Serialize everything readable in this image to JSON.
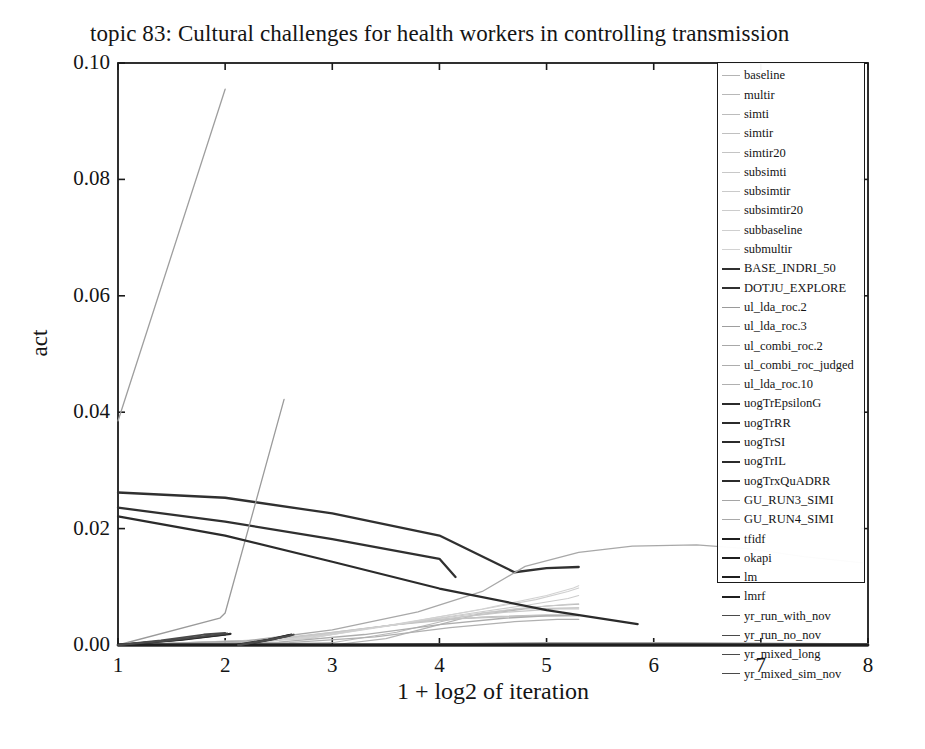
{
  "chart_data": {
    "type": "line",
    "title": "topic 83: Cultural challenges for health workers in controlling transmission",
    "xlabel": "1 + log2 of iteration",
    "ylabel": "act",
    "xlim": [
      1,
      8
    ],
    "ylim": [
      0.0,
      0.1
    ],
    "xticks": [
      "1",
      "2",
      "3",
      "4",
      "5",
      "6",
      "7",
      "8"
    ],
    "yticks": [
      "0.00",
      "0.02",
      "0.04",
      "0.06",
      "0.08",
      "0.10"
    ],
    "grid": false,
    "legend_position": "top-right-inside",
    "series": [
      {
        "name": "baseline",
        "color": "#b4b4b4",
        "width": 1.1,
        "points": [
          [
            1,
            0.0
          ],
          [
            2,
            0.0
          ],
          [
            3,
            0.0
          ],
          [
            3.5,
            0.0011
          ],
          [
            4,
            0.0035
          ],
          [
            4.4,
            0.0055
          ],
          [
            5,
            0.0067
          ],
          [
            5.3,
            0.007
          ]
        ]
      },
      {
        "name": "multir",
        "color": "#b8b8b8",
        "width": 1.1,
        "points": [
          [
            1,
            0.0
          ],
          [
            2,
            0.0
          ],
          [
            3,
            0.0004
          ],
          [
            3.6,
            0.0022
          ],
          [
            4.2,
            0.0048
          ],
          [
            4.8,
            0.0062
          ],
          [
            5.3,
            0.0064
          ]
        ]
      },
      {
        "name": "simti",
        "color": "#bcbcbc",
        "width": 1.1,
        "points": [
          [
            1,
            0.0
          ],
          [
            2,
            0.0002
          ],
          [
            2.8,
            0.0012
          ],
          [
            3.4,
            0.003
          ],
          [
            3.9,
            0.0042
          ],
          [
            4.5,
            0.0049
          ],
          [
            5.0,
            0.0052
          ],
          [
            5.3,
            0.0052
          ]
        ]
      },
      {
        "name": "simtir",
        "color": "#c0c0c0",
        "width": 1.1,
        "points": [
          [
            1,
            0.0
          ],
          [
            2,
            0.0003
          ],
          [
            2.9,
            0.0018
          ],
          [
            3.6,
            0.0035
          ],
          [
            4.2,
            0.0045
          ],
          [
            4.8,
            0.005
          ],
          [
            5.3,
            0.0051
          ]
        ]
      },
      {
        "name": "simtir20",
        "color": "#c4c4c4",
        "width": 1.1,
        "points": [
          [
            1,
            0.0
          ],
          [
            2.2,
            0.0006
          ],
          [
            3.0,
            0.0022
          ],
          [
            3.8,
            0.004
          ],
          [
            4.4,
            0.0048
          ],
          [
            5.0,
            0.005
          ],
          [
            5.3,
            0.005
          ]
        ]
      },
      {
        "name": "subsimti",
        "color": "#c8c8c8",
        "width": 1.1,
        "points": [
          [
            1,
            0.0
          ],
          [
            2.4,
            0.0008
          ],
          [
            3.2,
            0.0026
          ],
          [
            4.0,
            0.0044
          ],
          [
            4.6,
            0.0056
          ],
          [
            5.1,
            0.0062
          ],
          [
            5.3,
            0.0062
          ]
        ]
      },
      {
        "name": "subsimtir",
        "color": "#cacaca",
        "width": 1.1,
        "points": [
          [
            1,
            0.0
          ],
          [
            2.5,
            0.0009
          ],
          [
            3.3,
            0.0028
          ],
          [
            4.1,
            0.0048
          ],
          [
            4.7,
            0.0062
          ],
          [
            5.2,
            0.007
          ],
          [
            5.3,
            0.0071
          ]
        ]
      },
      {
        "name": "subsimtir20",
        "color": "#cccccc",
        "width": 1.1,
        "points": [
          [
            1,
            0.0
          ],
          [
            2.6,
            0.001
          ],
          [
            3.4,
            0.003
          ],
          [
            4.2,
            0.0052
          ],
          [
            4.8,
            0.0068
          ],
          [
            5.2,
            0.008
          ],
          [
            5.3,
            0.0085
          ]
        ]
      },
      {
        "name": "subbaseline",
        "color": "#cfcfcf",
        "width": 1.1,
        "points": [
          [
            1,
            0.0
          ],
          [
            2.7,
            0.0011
          ],
          [
            3.5,
            0.0033
          ],
          [
            4.3,
            0.0058
          ],
          [
            4.9,
            0.0078
          ],
          [
            5.2,
            0.0092
          ],
          [
            5.3,
            0.0098
          ]
        ]
      },
      {
        "name": "submultir",
        "color": "#d2d2d2",
        "width": 1.1,
        "points": [
          [
            1,
            0.0
          ],
          [
            2.8,
            0.0012
          ],
          [
            3.6,
            0.0035
          ],
          [
            4.4,
            0.0062
          ],
          [
            5.0,
            0.0085
          ],
          [
            5.25,
            0.0098
          ],
          [
            5.3,
            0.0102
          ]
        ]
      },
      {
        "name": "BASE_INDRI_50",
        "color": "#303030",
        "width": 2.3,
        "points": [
          [
            1,
            0.0262
          ],
          [
            2,
            0.0253
          ],
          [
            3,
            0.0226
          ],
          [
            4,
            0.0188
          ],
          [
            4.7,
            0.0125
          ],
          [
            5.0,
            0.0132
          ],
          [
            5.3,
            0.0134
          ]
        ]
      },
      {
        "name": "DOTJU_EXPLORE",
        "color": "#303030",
        "width": 2.3,
        "points": [
          [
            1,
            0.0236
          ],
          [
            2,
            0.0212
          ],
          [
            3,
            0.0182
          ],
          [
            4,
            0.0148
          ],
          [
            4.15,
            0.0117
          ]
        ]
      },
      {
        "name": "ul_lda_roc.2",
        "color": "#9a9a9a",
        "width": 1.3,
        "points": [
          [
            1,
            0.0
          ],
          [
            1.95,
            0.0046
          ],
          [
            2.0,
            0.0055
          ],
          [
            2.55,
            0.0422
          ]
        ]
      },
      {
        "name": "ul_lda_roc.3",
        "color": "#9e9e9e",
        "width": 1.3,
        "points": [
          [
            1,
            0.0385
          ],
          [
            2,
            0.0955
          ]
        ]
      },
      {
        "name": "ul_combi_roc.2",
        "color": "#a8a8a8",
        "width": 1.3,
        "points": [
          [
            1,
            0.0
          ],
          [
            2.2,
            0.0007
          ],
          [
            3.0,
            0.0026
          ],
          [
            3.8,
            0.0057
          ],
          [
            4.4,
            0.0092
          ],
          [
            4.8,
            0.0135
          ],
          [
            5.3,
            0.0159
          ],
          [
            5.8,
            0.017
          ],
          [
            6.4,
            0.0172
          ],
          [
            6.9,
            0.0165
          ],
          [
            7.4,
            0.0152
          ],
          [
            7.95,
            0.0141
          ]
        ]
      },
      {
        "name": "ul_combi_roc_judged",
        "color": "#adadad",
        "width": 1.3,
        "points": [
          [
            1,
            0.0
          ],
          [
            2.5,
            0.0005
          ],
          [
            3.3,
            0.0018
          ],
          [
            4.0,
            0.0035
          ],
          [
            4.6,
            0.0046
          ],
          [
            5.0,
            0.005
          ],
          [
            5.3,
            0.0051
          ]
        ]
      },
      {
        "name": "ul_lda_roc.10",
        "color": "#b0b0b0",
        "width": 1.3,
        "points": [
          [
            1,
            0.0
          ],
          [
            2.6,
            0.0004
          ],
          [
            3.4,
            0.0014
          ],
          [
            4.1,
            0.003
          ],
          [
            4.7,
            0.004
          ],
          [
            5.1,
            0.0044
          ],
          [
            5.3,
            0.0044
          ]
        ]
      },
      {
        "name": "uogTrEpsilonG",
        "color": "#2b2b2b",
        "width": 2.2,
        "points": [
          [
            1,
            0.0221
          ],
          [
            2,
            0.0188
          ],
          [
            3,
            0.0143
          ],
          [
            4,
            0.0097
          ],
          [
            5,
            0.006
          ],
          [
            5.85,
            0.0036
          ]
        ]
      },
      {
        "name": "uogTrRR",
        "color": "#2b2b2b",
        "width": 2.2,
        "points": [
          [
            1,
            0.0
          ],
          [
            1.5,
            0.0008
          ],
          [
            2.0,
            0.0018
          ]
        ]
      },
      {
        "name": "uogTrSI",
        "color": "#2b2b2b",
        "width": 2.2,
        "points": [
          [
            1,
            0.0
          ],
          [
            1.6,
            0.0009
          ],
          [
            2.05,
            0.0019
          ]
        ]
      },
      {
        "name": "uogTrIL",
        "color": "#2b2b2b",
        "width": 2.2,
        "points": [
          [
            2.1,
            0.0
          ],
          [
            2.4,
            0.0009
          ],
          [
            2.6,
            0.0017
          ]
        ]
      },
      {
        "name": "uogTrxQuADRR",
        "color": "#2b2b2b",
        "width": 2.2,
        "points": [
          [
            2.15,
            0.0
          ],
          [
            2.45,
            0.001
          ],
          [
            2.62,
            0.0018
          ]
        ]
      },
      {
        "name": "GU_RUN3_SIMI",
        "color": "#a5a5a5",
        "width": 1.3,
        "points": [
          [
            1,
            0.0
          ],
          [
            2,
            0.0
          ],
          [
            3,
            0.0
          ],
          [
            4,
            0.0002
          ],
          [
            5,
            0.0004
          ],
          [
            6,
            0.0004
          ],
          [
            7,
            0.0003
          ],
          [
            8,
            0.0002
          ]
        ]
      },
      {
        "name": "GU_RUN4_SIMI",
        "color": "#a9a9a9",
        "width": 1.3,
        "points": [
          [
            1,
            0.0
          ],
          [
            2,
            0.0
          ],
          [
            3,
            0.0
          ],
          [
            4,
            0.0002
          ],
          [
            5,
            0.0003
          ],
          [
            6,
            0.0003
          ],
          [
            7,
            0.0002
          ],
          [
            8,
            0.0002
          ]
        ]
      },
      {
        "name": "tfidf",
        "color": "#1f1f1f",
        "width": 2.4,
        "points": [
          [
            1,
            0.0
          ],
          [
            2,
            0.0
          ],
          [
            3,
            0.0
          ],
          [
            4,
            0.0
          ],
          [
            5,
            0.0
          ],
          [
            6,
            0.0
          ],
          [
            7,
            0.0
          ],
          [
            8,
            0.0
          ]
        ]
      },
      {
        "name": "okapi",
        "color": "#1f1f1f",
        "width": 2.4,
        "points": [
          [
            1,
            0.0
          ],
          [
            2,
            0.0
          ],
          [
            3,
            0.0
          ],
          [
            4,
            0.0
          ],
          [
            5,
            0.0
          ],
          [
            6,
            0.0
          ],
          [
            7,
            0.0
          ],
          [
            8,
            0.0
          ]
        ]
      },
      {
        "name": "lm",
        "color": "#1f1f1f",
        "width": 2.4,
        "points": [
          [
            1,
            0.0
          ],
          [
            2,
            0.0
          ],
          [
            3,
            0.0
          ],
          [
            4,
            0.0
          ],
          [
            5,
            0.0
          ],
          [
            6,
            0.0
          ],
          [
            7,
            0.0
          ],
          [
            8,
            0.0
          ]
        ]
      },
      {
        "name": "lmrf",
        "color": "#1f1f1f",
        "width": 2.4,
        "points": [
          [
            1,
            0.0
          ],
          [
            2,
            0.0
          ],
          [
            3,
            0.0
          ],
          [
            4,
            0.0
          ],
          [
            5,
            0.0
          ],
          [
            6,
            0.0
          ],
          [
            7,
            0.0
          ],
          [
            8,
            0.0
          ]
        ]
      },
      {
        "name": "yr_run_with_nov",
        "color": "#4a4a4a",
        "width": 1.8,
        "points": [
          [
            1,
            0.0
          ],
          [
            1.4,
            0.0008
          ],
          [
            1.8,
            0.0018
          ],
          [
            2.0,
            0.0021
          ]
        ]
      },
      {
        "name": "yr_run_no_nov",
        "color": "#4a4a4a",
        "width": 1.8,
        "points": [
          [
            1,
            0.0
          ],
          [
            1.45,
            0.0007
          ],
          [
            1.85,
            0.0016
          ],
          [
            2.02,
            0.002
          ]
        ]
      },
      {
        "name": "yr_mixed_long",
        "color": "#4a4a4a",
        "width": 1.8,
        "points": [
          [
            2.12,
            0.0
          ],
          [
            2.35,
            0.0007
          ],
          [
            2.55,
            0.0014
          ],
          [
            2.62,
            0.0017
          ]
        ]
      },
      {
        "name": "yr_mixed_sim_nov",
        "color": "#4a4a4a",
        "width": 1.8,
        "points": [
          [
            2.14,
            0.0
          ],
          [
            2.38,
            0.0008
          ],
          [
            2.58,
            0.0015
          ],
          [
            2.64,
            0.0018
          ]
        ]
      }
    ]
  },
  "legend": {
    "items": [
      {
        "label": "baseline",
        "color": "#b4b4b4",
        "width": 1.1
      },
      {
        "label": "multir",
        "color": "#b8b8b8",
        "width": 1.1
      },
      {
        "label": "simti",
        "color": "#bcbcbc",
        "width": 1.1
      },
      {
        "label": "simtir",
        "color": "#c0c0c0",
        "width": 1.1
      },
      {
        "label": "simtir20",
        "color": "#c4c4c4",
        "width": 1.1
      },
      {
        "label": "subsimti",
        "color": "#c8c8c8",
        "width": 1.1
      },
      {
        "label": "subsimtir",
        "color": "#cacaca",
        "width": 1.1
      },
      {
        "label": "subsimtir20",
        "color": "#cccccc",
        "width": 1.1
      },
      {
        "label": "subbaseline",
        "color": "#cfcfcf",
        "width": 1.1
      },
      {
        "label": "submultir",
        "color": "#d2d2d2",
        "width": 1.1
      },
      {
        "label": "BASE_INDRI_50",
        "color": "#303030",
        "width": 2.6
      },
      {
        "label": "DOTJU_EXPLORE",
        "color": "#303030",
        "width": 2.6
      },
      {
        "label": "ul_lda_roc.2",
        "color": "#9a9a9a",
        "width": 1.3
      },
      {
        "label": "ul_lda_roc.3",
        "color": "#9e9e9e",
        "width": 1.3
      },
      {
        "label": "ul_combi_roc.2",
        "color": "#a8a8a8",
        "width": 1.3
      },
      {
        "label": "ul_combi_roc_judged",
        "color": "#adadad",
        "width": 1.3
      },
      {
        "label": "ul_lda_roc.10",
        "color": "#b0b0b0",
        "width": 1.3
      },
      {
        "label": "uogTrEpsilonG",
        "color": "#2b2b2b",
        "width": 2.4
      },
      {
        "label": "uogTrRR",
        "color": "#2b2b2b",
        "width": 2.4
      },
      {
        "label": "uogTrSI",
        "color": "#2b2b2b",
        "width": 2.4
      },
      {
        "label": "uogTrIL",
        "color": "#2b2b2b",
        "width": 2.4
      },
      {
        "label": "uogTrxQuADRR",
        "color": "#2b2b2b",
        "width": 2.4
      },
      {
        "label": "GU_RUN3_SIMI",
        "color": "#a5a5a5",
        "width": 1.4
      },
      {
        "label": "GU_RUN4_SIMI",
        "color": "#a9a9a9",
        "width": 1.4
      },
      {
        "label": "tfidf",
        "color": "#1f1f1f",
        "width": 2.8
      },
      {
        "label": "okapi",
        "color": "#1f1f1f",
        "width": 2.8
      },
      {
        "label": "lm",
        "color": "#1f1f1f",
        "width": 2.8
      },
      {
        "label": "lmrf",
        "color": "#1f1f1f",
        "width": 2.8
      },
      {
        "label": "yr_run_with_nov",
        "color": "#4a4a4a",
        "width": 1.9
      },
      {
        "label": "yr_run_no_nov",
        "color": "#4a4a4a",
        "width": 1.9
      },
      {
        "label": "yr_mixed_long",
        "color": "#4a4a4a",
        "width": 1.9
      },
      {
        "label": "yr_mixed_sim_nov",
        "color": "#4a4a4a",
        "width": 1.9
      }
    ]
  },
  "colors": {
    "axis": "#1a1a1a",
    "text": "#141414",
    "background": "#ffffff"
  }
}
